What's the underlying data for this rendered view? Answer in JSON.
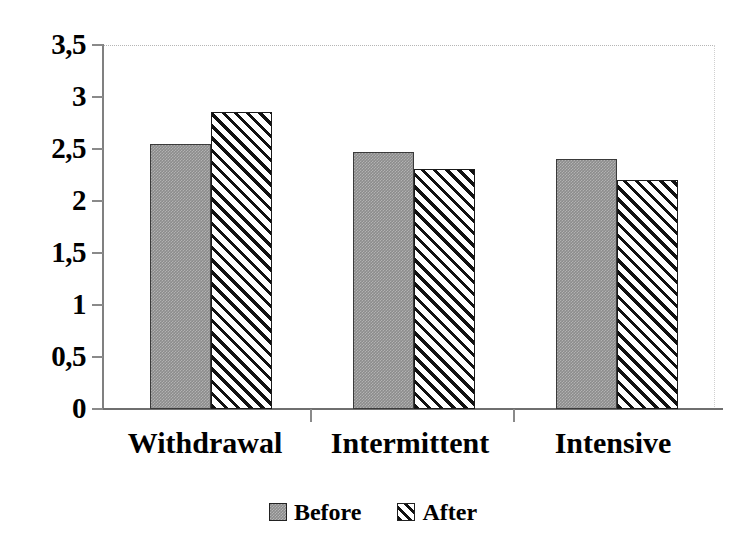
{
  "chart_data": {
    "type": "bar",
    "title": "",
    "xlabel": "",
    "ylabel": "",
    "categories": [
      "Withdrawal",
      "Intermittent",
      "Intensive"
    ],
    "series": [
      {
        "name": "Before",
        "values": [
          2.55,
          2.47,
          2.4
        ],
        "fill": "solid-gray",
        "color": "#8c8c8c"
      },
      {
        "name": "After",
        "values": [
          2.86,
          2.31,
          2.2
        ],
        "fill": "diagonal-hatch",
        "color": "#ffffff"
      }
    ],
    "ylim": [
      0,
      3.5
    ],
    "yticks": [
      0,
      0.5,
      1,
      1.5,
      2,
      2.5,
      3,
      3.5
    ],
    "ytick_labels": [
      "0",
      "0,5",
      "1",
      "1,5",
      "2",
      "2,5",
      "3",
      "3,5"
    ],
    "grid": false,
    "legend_position": "bottom-center",
    "decimal_separator": ","
  },
  "axis": {
    "y_labels": [
      "3,5",
      "3",
      "2,5",
      "2",
      "1,5",
      "1",
      "0,5",
      "0"
    ],
    "y_values": [
      3.5,
      3,
      2.5,
      2,
      1.5,
      1,
      0.5,
      0
    ]
  },
  "legend": {
    "items": [
      {
        "label": "Before",
        "swatch": "solid-gray-swatch"
      },
      {
        "label": "After",
        "swatch": "diagonal-hatch-swatch"
      }
    ]
  },
  "colors": {
    "before_fill": "#8c8c8c",
    "after_fill": "#ffffff",
    "hatch": "#111111",
    "axis": "#808080",
    "text": "#000000"
  }
}
